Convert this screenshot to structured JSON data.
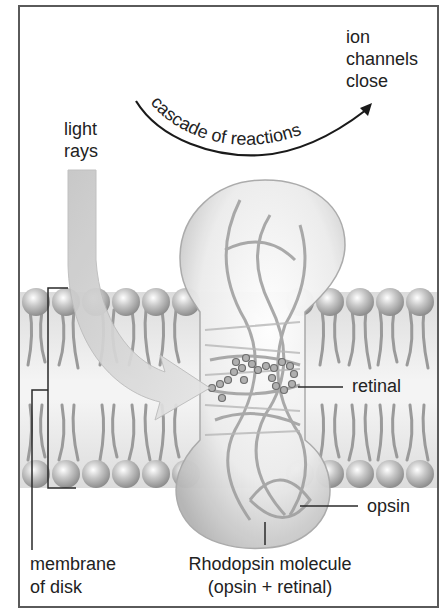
{
  "diagram": {
    "labels": {
      "ion_channels": [
        "ion",
        "channels",
        "close"
      ],
      "cascade": "cascade of reactions",
      "light_rays": [
        "light",
        "rays"
      ],
      "retinal": "retinal",
      "opsin": "opsin",
      "membrane": [
        "membrane",
        "of disk"
      ],
      "rhodopsin": [
        "Rhodopsin molecule",
        "(opsin + retinal)"
      ]
    },
    "colors": {
      "frame": "#5a5a5a",
      "text": "#222222",
      "membrane_head": "#b8b8b8",
      "membrane_tail": "#9a9a9a",
      "light_arrow": "#d2d2d2",
      "molecule": "#e4e4e4"
    }
  }
}
